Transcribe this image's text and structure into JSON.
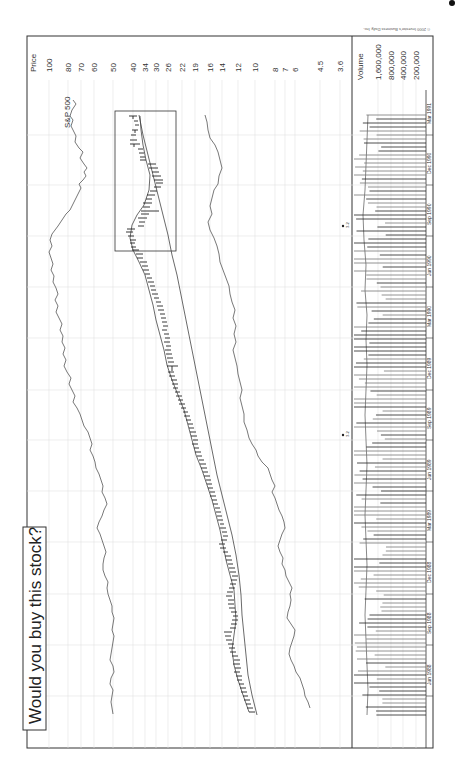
{
  "title": "Would you buy this stock?",
  "copyright": "© 2000 Investor's Business Daily, Inc.",
  "colors": {
    "line": "#444444",
    "grid": "#dcdcdc",
    "frame": "#333333",
    "bars": "#222222"
  },
  "chart_data": {
    "type": "line",
    "title": "Would you buy this stock?",
    "orientation": "rotated 90° counter-clockwise (time runs bottom to top, price increases to the left)",
    "ylabel": "Price",
    "price_ticks": [
      "100",
      "80",
      "70",
      "60",
      "50",
      "40",
      "34",
      "30",
      "26",
      "22",
      "19",
      "16",
      "14",
      "12",
      "10",
      "8",
      "7",
      "6",
      "4.5",
      "3.6"
    ],
    "volume_label": "Volume",
    "volume_ticks": [
      "1,600,000",
      "800,000",
      "400,000",
      "200,000"
    ],
    "x_ticks": [
      "Jun 1988",
      "Sep 1988",
      "Dec 1988",
      "Mar 1989",
      "Jun 1989",
      "Sep 1989",
      "Dec 1989",
      "Mar 1990",
      "Jun 1990",
      "Sep 1990",
      "Dec 1990",
      "Mar 1991"
    ],
    "grid": true,
    "annotations": [
      "S&P 500",
      "3-for-2 split marker (≈Sep 1989)",
      "3-for-2 split marker (≈Sep 1990)",
      "Highlighted box around Sep 1990 – Mar 1991 price action"
    ],
    "series": [
      {
        "name": "Stock price (daily bars)",
        "x": [
          "Jun 1988",
          "Sep 1988",
          "Dec 1988",
          "Mar 1989",
          "Jun 1989",
          "Sep 1989",
          "Dec 1989",
          "Mar 1990",
          "Jun 1990",
          "Aug 1990",
          "Sep 1990",
          "Oct 1990",
          "Dec 1990",
          "Mar 1991"
        ],
        "values": [
          7.5,
          9.5,
          11,
          13,
          17,
          21,
          26,
          30,
          34,
          40,
          42,
          33,
          30,
          38
        ]
      },
      {
        "name": "200-day moving average",
        "x": [
          "Jun 1988",
          "Sep 1988",
          "Dec 1988",
          "Mar 1989",
          "Jun 1989",
          "Sep 1989",
          "Dec 1989",
          "Mar 1990",
          "Jun 1990",
          "Sep 1990",
          "Dec 1990",
          "Mar 1991"
        ],
        "values": [
          7,
          8,
          8.5,
          10,
          12,
          15,
          18,
          22,
          26,
          30,
          34,
          36
        ]
      },
      {
        "name": "50-day moving average",
        "x": [
          "Jun 1988",
          "Sep 1988",
          "Dec 1988",
          "Mar 1989",
          "Jun 1989",
          "Sep 1989",
          "Dec 1989",
          "Mar 1990",
          "Jun 1990",
          "Sep 1990",
          "Dec 1990",
          "Mar 1991"
        ],
        "values": [
          7.5,
          9,
          10.5,
          13,
          16,
          20,
          25,
          29,
          33,
          39,
          31,
          37
        ]
      },
      {
        "name": "Relative strength line",
        "x": [
          "Jun 1988",
          "Sep 1988",
          "Dec 1988",
          "Mar 1989",
          "Jun 1989",
          "Sep 1989",
          "Dec 1989",
          "Mar 1990",
          "Jun 1990",
          "Sep 1990",
          "Dec 1990",
          "Mar 1991"
        ],
        "values": [
          5,
          5.2,
          5.8,
          6.5,
          8,
          9.5,
          10,
          11.5,
          12.5,
          14,
          13,
          15.5
        ]
      },
      {
        "name": "S&P 500",
        "x": [
          "Jun 1988",
          "Sep 1988",
          "Dec 1988",
          "Mar 1989",
          "Jun 1989",
          "Sep 1989",
          "Dec 1989",
          "Mar 1990",
          "Jun 1990",
          "Aug 1990",
          "Oct 1990",
          "Dec 1990",
          "Mar 1991"
        ],
        "values": [
          53,
          55,
          57,
          60,
          64,
          68,
          70,
          66,
          72,
          62,
          60,
          66,
          80
        ]
      }
    ]
  }
}
